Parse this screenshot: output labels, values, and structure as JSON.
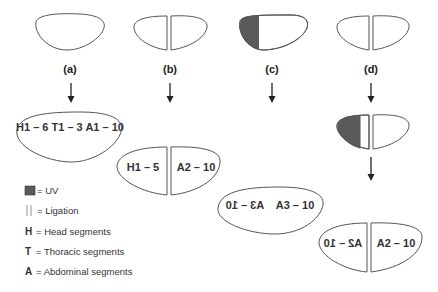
{
  "columns": [
    {
      "id": "a",
      "label": "(a)",
      "treatment": "none",
      "result": {
        "type": "whole",
        "text": "H1 – 6 T1 – 3 A1 – 10"
      }
    },
    {
      "id": "b",
      "label": "(b)",
      "treatment": "ligation",
      "result": {
        "type": "ligated",
        "left_text": "H1 – 5",
        "right_text": "A2 – 10"
      }
    },
    {
      "id": "c",
      "label": "(c)",
      "treatment": "uv-anterior",
      "result": {
        "type": "whole",
        "left_text": "A3 – 10",
        "right_text": "A3 – 10",
        "left_mirrored": true
      }
    },
    {
      "id": "d",
      "label": "(d)",
      "treatment": "uv-then-ligation",
      "result": {
        "type": "ligated",
        "left_text": "A2 – 10",
        "right_text": "A2 – 10",
        "left_mirrored": true
      }
    }
  ],
  "legend": {
    "uv": {
      "symbol": "uv-swatch",
      "text": "= UV"
    },
    "ligation": {
      "symbol": "||",
      "text": "=  Ligation"
    },
    "head": {
      "symbol": "H",
      "text": "= Head segments"
    },
    "thoracic": {
      "symbol": "T",
      "text": "= Thoracic segments"
    },
    "abdominal": {
      "symbol": "A",
      "text": "= Abdominal segments"
    }
  },
  "colors": {
    "uv": "#5a5a5a",
    "outline": "#555555",
    "text": "#222222"
  }
}
